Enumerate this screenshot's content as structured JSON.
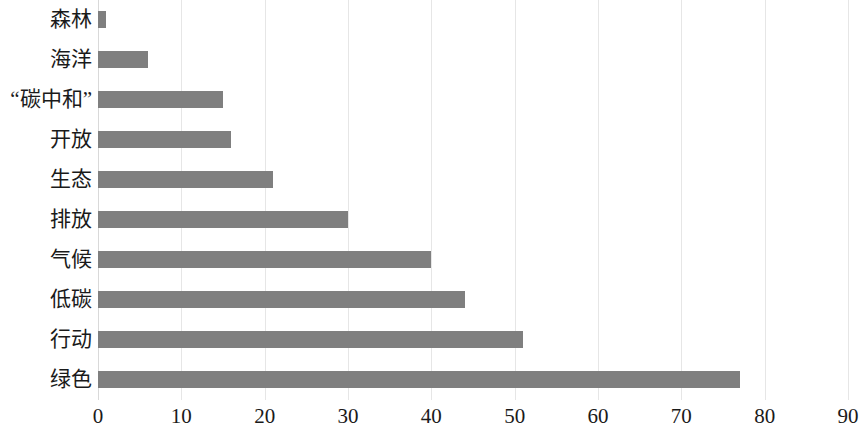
{
  "chart_data": {
    "type": "bar",
    "orientation": "horizontal",
    "title": "",
    "subtitle": "",
    "xlabel": "",
    "ylabel": "",
    "xlim": [
      0,
      90
    ],
    "xticks": [
      0,
      10,
      20,
      30,
      40,
      50,
      60,
      70,
      80,
      90
    ],
    "xtick_labels": [
      "0",
      "10",
      "20",
      "30",
      "40",
      "50",
      "60",
      "70",
      "80",
      "90"
    ],
    "grid": "vertical",
    "legend": "none",
    "bar_color": "#7f7f7f",
    "gridline_color": "#e6e6e6",
    "categories": [
      "森林",
      "海洋",
      "“碳中和”",
      "开放",
      "生态",
      "排放",
      "气候",
      "低碳",
      "行动",
      "绿色"
    ],
    "values": [
      1,
      6,
      15,
      16,
      21,
      30,
      40,
      44,
      51,
      77
    ],
    "bars": [
      {
        "category": "森林",
        "value": 1
      },
      {
        "category": "海洋",
        "value": 6
      },
      {
        "category": "“碳中和”",
        "value": 15
      },
      {
        "category": "开放",
        "value": 16
      },
      {
        "category": "生态",
        "value": 21
      },
      {
        "category": "排放",
        "value": 30
      },
      {
        "category": "气候",
        "value": 40
      },
      {
        "category": "低碳",
        "value": 44
      },
      {
        "category": "行动",
        "value": 51
      },
      {
        "category": "绿色",
        "value": 77
      }
    ]
  }
}
